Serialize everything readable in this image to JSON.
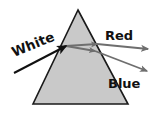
{
  "figure": {
    "background_color": "#ffffff",
    "width": 154,
    "height": 114
  },
  "prism": {
    "name": "triangular-prism",
    "shape": "triangle",
    "fill_color": "#c9c9c9",
    "stroke_color": "#1a1a1a",
    "stroke_width": 1.6,
    "apex": {
      "x": 78,
      "y": 10
    },
    "base_left": {
      "x": 33,
      "y": 104
    },
    "base_right": {
      "x": 128,
      "y": 104
    }
  },
  "labels": {
    "white": "White",
    "red": "Red",
    "blue": "Blue"
  },
  "label_positions": {
    "white": {
      "x": 14,
      "y": 57,
      "rotation": -22
    },
    "red": {
      "x": 105,
      "y": 40,
      "rotation": 0
    },
    "blue": {
      "x": 108,
      "y": 88,
      "rotation": 0
    }
  },
  "rays": [
    {
      "name": "incident-white-ray",
      "label": "White",
      "color": "#111111",
      "stroke_width": 2.0,
      "start": {
        "x": 14,
        "y": 73
      },
      "end": {
        "x": 66,
        "y": 46
      },
      "arrowhead": "at-end"
    },
    {
      "name": "internal-red-ray",
      "label": "Red (internal)",
      "color": "#6e6e6e",
      "stroke_width": 1.8,
      "start": {
        "x": 66,
        "y": 46
      },
      "end": {
        "x": 97,
        "y": 44
      },
      "arrowhead": "at-end"
    },
    {
      "name": "internal-blue-ray",
      "label": "Blue (internal)",
      "color": "#6e6e6e",
      "stroke_width": 1.8,
      "start": {
        "x": 66,
        "y": 46
      },
      "end": {
        "x": 95,
        "y": 51
      },
      "arrowhead": "at-end"
    },
    {
      "name": "refracted-red-ray",
      "label": "Red",
      "color": "#6e6e6e",
      "stroke_width": 1.8,
      "start": {
        "x": 97,
        "y": 44
      },
      "end": {
        "x": 148,
        "y": 49
      },
      "arrowhead": "at-end"
    },
    {
      "name": "refracted-blue-ray",
      "label": "Blue",
      "color": "#6e6e6e",
      "stroke_width": 1.8,
      "start": {
        "x": 95,
        "y": 51
      },
      "end": {
        "x": 147,
        "y": 71
      },
      "arrowhead": "at-end"
    }
  ],
  "colors": {
    "prism_fill": "#c9c9c9",
    "prism_outline": "#1a1a1a",
    "white_ray": "#111111",
    "dispersed_ray": "#6e6e6e",
    "text": "#111111"
  }
}
